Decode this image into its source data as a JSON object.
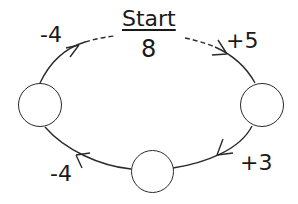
{
  "diagram": {
    "type": "number-cycle",
    "start": {
      "label": "Start",
      "value": "8"
    },
    "steps": [
      {
        "id": "step-1",
        "operation": "+5",
        "from": "start",
        "to": "right-node"
      },
      {
        "id": "step-2",
        "operation": "+3",
        "from": "right-node",
        "to": "bottom-node"
      },
      {
        "id": "step-3",
        "operation": "-4",
        "from": "bottom-node",
        "to": "left-node"
      },
      {
        "id": "step-4",
        "operation": "-4",
        "from": "left-node",
        "to": "start"
      }
    ],
    "nodes": [
      {
        "id": "right-node",
        "value": ""
      },
      {
        "id": "bottom-node",
        "value": ""
      },
      {
        "id": "left-node",
        "value": ""
      }
    ],
    "labels": {
      "top_right": "+5",
      "bottom_right": "+3",
      "bottom_left": "-4",
      "top_left": "-4"
    },
    "colors": {
      "stroke": "#2a2a2a",
      "text": "#1a1a1a",
      "background": "#ffffff"
    }
  }
}
